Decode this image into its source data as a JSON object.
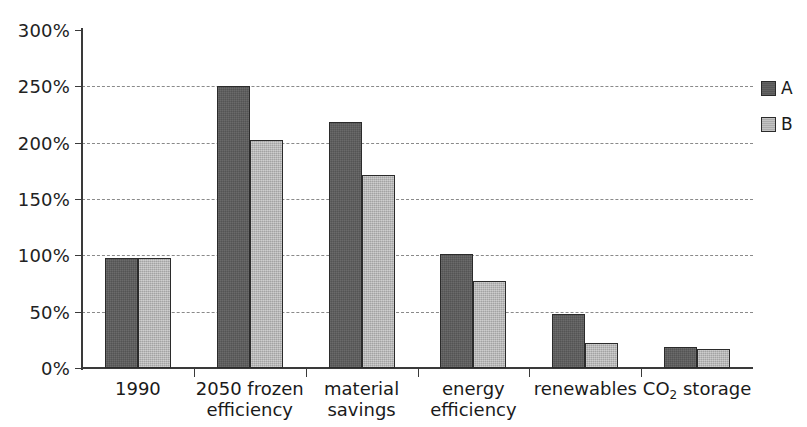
{
  "chart_data": {
    "type": "bar",
    "title": "",
    "xlabel": "",
    "ylabel": "",
    "ylim": [
      0,
      300
    ],
    "y_tick_labels": [
      "0%",
      "50%",
      "100%",
      "150%",
      "200%",
      "250%",
      "300%"
    ],
    "y_tick_values": [
      0,
      50,
      100,
      150,
      200,
      250,
      300
    ],
    "grid": "horizontal-dashed",
    "legend_position": "right",
    "categories": [
      "1990",
      "2050 frozen efficiency",
      "material savings",
      "energy efficiency",
      "renewables",
      "CO2 storage"
    ],
    "category_labels": [
      [
        "1990"
      ],
      [
        "2050 frozen",
        "efficiency"
      ],
      [
        "material",
        "savings"
      ],
      [
        "energy",
        "efficiency"
      ],
      [
        "renewables"
      ],
      [
        "CO",
        "2",
        " storage"
      ]
    ],
    "series": [
      {
        "name": "A",
        "color": "#5c5c5c",
        "values": [
          98,
          250,
          218,
          101,
          48,
          19
        ]
      },
      {
        "name": "B",
        "color": "#b4b4b4",
        "values": [
          98,
          202,
          171,
          77,
          22,
          17
        ]
      }
    ]
  },
  "legend": {
    "entries": [
      {
        "label": "A",
        "color": "#5c5c5c"
      },
      {
        "label": "B",
        "color": "#b4b4b4"
      }
    ]
  }
}
